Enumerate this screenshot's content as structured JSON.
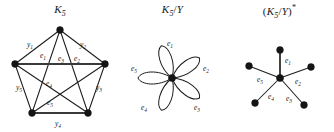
{
  "figure": {
    "caption_present": false,
    "background_color": "#ffffff",
    "ink_color": "#1a1a1a"
  },
  "panels": [
    {
      "id": "k5",
      "title": {
        "base": "K",
        "subscript": "5",
        "full": "K5"
      },
      "graph_type": "complete-graph",
      "vertex_count": 5,
      "edge_count": 10,
      "vertices": [
        {
          "id": "v-top",
          "cx": 60,
          "cy": 30
        },
        {
          "id": "v-right",
          "cx": 105,
          "cy": 64
        },
        {
          "id": "v-bottom-right",
          "cx": 88,
          "cy": 113
        },
        {
          "id": "v-bottom-left",
          "cx": 32,
          "cy": 113
        },
        {
          "id": "v-left",
          "cx": 15,
          "cy": 64
        }
      ],
      "outer_edge_labels": [
        {
          "name": "y",
          "index": "1",
          "x": 30,
          "y": 47
        },
        {
          "name": "y",
          "index": "2",
          "x": 83,
          "y": 47
        },
        {
          "name": "y",
          "index": "3",
          "x": 99,
          "y": 90
        },
        {
          "name": "y",
          "index": "4",
          "x": 58,
          "y": 125
        },
        {
          "name": "y",
          "index": "5",
          "x": 19,
          "y": 90
        }
      ],
      "inner_edge_labels": [
        {
          "name": "e",
          "index": "1",
          "x": 43,
          "y": 57
        },
        {
          "name": "e",
          "index": "2",
          "x": 76,
          "y": 60
        },
        {
          "name": "e",
          "index": "3",
          "x": 61,
          "y": 62
        },
        {
          "name": "e",
          "index": "4",
          "x": 49,
          "y": 85
        },
        {
          "name": "e",
          "index": "5",
          "x": 50,
          "y": 104
        }
      ]
    },
    {
      "id": "quotient",
      "title": {
        "base": "K",
        "subscript": "5",
        "slash": "/",
        "quotient_by": "Y",
        "full": "K5/Y"
      },
      "graph_type": "bouquet-of-loops",
      "vertex_count": 1,
      "loop_count": 5,
      "center": {
        "cx": 52,
        "cy": 78
      },
      "loops": [
        {
          "name": "e",
          "index": "1",
          "angle_deg": -90,
          "label_x": 50,
          "label_y": 46
        },
        {
          "name": "e",
          "index": "2",
          "angle_deg": -18,
          "label_x": 84,
          "label_y": 70
        },
        {
          "name": "e",
          "index": "3",
          "angle_deg": 54,
          "label_x": 75,
          "label_y": 107
        },
        {
          "name": "e",
          "index": "4",
          "angle_deg": 126,
          "label_x": 25,
          "label_y": 107
        },
        {
          "name": "e",
          "index": "5",
          "angle_deg": 198,
          "label_x": 15,
          "label_y": 70
        }
      ]
    },
    {
      "id": "dual",
      "title": {
        "open_paren": "(",
        "base": "K",
        "subscript": "5",
        "slash": "/",
        "quotient_by": "Y",
        "close_paren": ")",
        "star": "*",
        "full": "(K5/Y)*"
      },
      "graph_type": "star-graph",
      "vertex_count": 6,
      "edge_count": 5,
      "center": {
        "cx": 55,
        "cy": 78
      },
      "spokes": [
        {
          "name": "e",
          "index": "1",
          "tip_x": 55,
          "tip_y": 50,
          "label_x": 62,
          "label_y": 62
        },
        {
          "name": "e",
          "index": "2",
          "tip_x": 86,
          "tip_y": 67,
          "label_x": 72,
          "label_y": 82
        },
        {
          "name": "e",
          "index": "3",
          "tip_x": 79,
          "tip_y": 105,
          "label_x": 63,
          "label_y": 99
        },
        {
          "name": "e",
          "index": "4",
          "tip_x": 30,
          "tip_y": 103,
          "label_x": 46,
          "label_y": 97
        },
        {
          "name": "e",
          "index": "5",
          "tip_x": 24,
          "tip_y": 66,
          "label_x": 35,
          "label_y": 80
        }
      ]
    }
  ]
}
